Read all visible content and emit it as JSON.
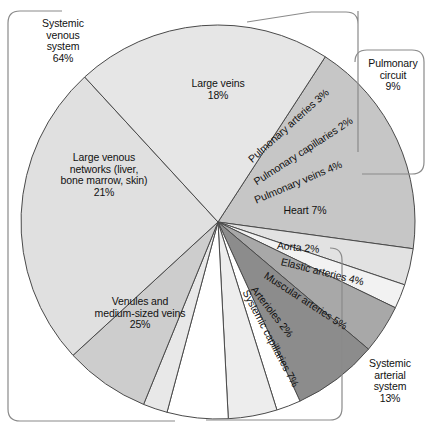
{
  "chart_data": {
    "type": "pie",
    "title": "",
    "subtitle": "",
    "xlabel": "",
    "ylabel": "",
    "legend_position": "none",
    "grid": false,
    "units": "percent of total blood volume",
    "total": 100,
    "categories": [
      "Large veins",
      "Pulmonary arteries",
      "Pulmonary capillaries",
      "Pulmonary veins",
      "Heart",
      "Aorta",
      "Elastic arteries",
      "Muscular arteries",
      "Arterioles",
      "Systemic capillaries",
      "Venules and medium-sized veins",
      "Large venous networks (liver, bone marrow, skin)"
    ],
    "values": [
      18,
      3,
      2,
      4,
      7,
      2,
      4,
      5,
      2,
      7,
      25,
      21
    ],
    "slices": [
      {
        "name": "Large veins",
        "label": "Large veins\n18%",
        "value": 18,
        "color": "#c6c6c6",
        "label_style": "horizontal"
      },
      {
        "name": "Pulmonary arteries",
        "label": "Pulmonary arteries 3%",
        "value": 3,
        "color": "#e2e2e2",
        "label_style": "radial"
      },
      {
        "name": "Pulmonary capillaries",
        "label": "Pulmonary capillaries 2%",
        "value": 2,
        "color": "#f2f2f2",
        "label_style": "radial"
      },
      {
        "name": "Pulmonary veins",
        "label": "Pulmonary veins 4%",
        "value": 4,
        "color": "#a8a8a8",
        "label_style": "radial"
      },
      {
        "name": "Heart",
        "label": "Heart 7%",
        "value": 7,
        "color": "#8c8c8c",
        "label_style": "horizontal"
      },
      {
        "name": "Aorta",
        "label": "Aorta 2%",
        "value": 2,
        "color": "#ffffff",
        "label_style": "radial"
      },
      {
        "name": "Elastic arteries",
        "label": "Elastic arteries 4%",
        "value": 4,
        "color": "#ededed",
        "label_style": "radial"
      },
      {
        "name": "Muscular arteries",
        "label": "Muscular arteries 5%",
        "value": 5,
        "color": "#ffffff",
        "label_style": "radial"
      },
      {
        "name": "Arterioles",
        "label": "Arterioles 2%",
        "value": 2,
        "color": "#e8e8e8",
        "label_style": "radial"
      },
      {
        "name": "Systemic capillaries",
        "label": "Systemic capillaries 7%",
        "value": 7,
        "color": "#cdcdcd",
        "label_style": "radial"
      },
      {
        "name": "Venules and medium-sized veins",
        "label": "Venules and\nmedium-sized veins\n25%",
        "value": 25,
        "color": "#e0e0e0",
        "label_style": "horizontal"
      },
      {
        "name": "Large venous networks",
        "label": "Large venous\nnetworks (liver,\nbone marrow, skin)\n21%",
        "value": 21,
        "color": "#e6e6e6",
        "label_style": "horizontal"
      }
    ],
    "groups": [
      {
        "name": "Systemic venous system",
        "label": "Systemic\nvenous\nsystem\n64%",
        "value": 64,
        "members": [
          "Large veins",
          "Large venous networks (liver, bone marrow, skin)",
          "Venules and medium-sized veins"
        ]
      },
      {
        "name": "Pulmonary circuit",
        "label": "Pulmonary\ncircuit\n9%",
        "value": 9,
        "members": [
          "Pulmonary arteries",
          "Pulmonary capillaries",
          "Pulmonary veins"
        ]
      },
      {
        "name": "Systemic arterial system",
        "label": "Systemic\narterial\nsystem\n13%",
        "value": 13,
        "members": [
          "Aorta",
          "Elastic arteries",
          "Muscular arteries",
          "Arterioles"
        ]
      }
    ]
  },
  "labels": {
    "large_veins": "Large veins\n18%",
    "pulmonary_arteries": "Pulmonary arteries 3%",
    "pulmonary_capillaries": "Pulmonary capillaries 2%",
    "pulmonary_veins": "Pulmonary veins 4%",
    "heart": "Heart 7%",
    "aorta": "Aorta 2%",
    "elastic_arteries": "Elastic arteries 4%",
    "muscular_arteries": "Muscular arteries 5%",
    "arterioles": "Arterioles 2%",
    "systemic_capillaries": "Systemic capillaries 7%",
    "venules": "Venules and\nmedium-sized veins\n25%",
    "large_venous_networks": "Large venous\nnetworks (liver,\nbone marrow, skin)\n21%",
    "systemic_venous_system": "Systemic\nvenous\nsystem\n64%",
    "pulmonary_circuit": "Pulmonary\ncircuit\n9%",
    "systemic_arterial_system": "Systemic\narterial\nsystem\n13%"
  },
  "colors": {
    "outline": "#4a4a4a",
    "bracket_outline": "#8a8a8a",
    "text": "#111111",
    "background": "#ffffff"
  }
}
